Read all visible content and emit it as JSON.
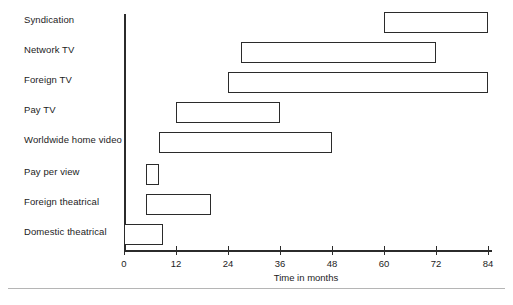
{
  "chart_data": {
    "type": "bar",
    "orientation": "horizontal",
    "subtype": "range-bar",
    "title": "",
    "xlabel": "Time in months",
    "ylabel": "",
    "xlim": [
      0,
      84
    ],
    "xticks": [
      0,
      12,
      24,
      36,
      48,
      60,
      72,
      84
    ],
    "xtick_labels": [
      "0",
      "12",
      "24",
      "36",
      "48",
      "60",
      "72",
      "84"
    ],
    "grid": false,
    "legend": "none",
    "categories": [
      "Syndication",
      "Network TV",
      "Foreign TV",
      "Pay TV",
      "Worldwide home video",
      "Pay per view",
      "Foreign theatrical",
      "Domestic theatrical"
    ],
    "bars": [
      {
        "label": "Syndication",
        "start": 60,
        "end": 84
      },
      {
        "label": "Network TV",
        "start": 27,
        "end": 72
      },
      {
        "label": "Foreign TV",
        "start": 24,
        "end": 84
      },
      {
        "label": "Pay TV",
        "start": 12,
        "end": 36
      },
      {
        "label": "Worldwide home video",
        "start": 8,
        "end": 48
      },
      {
        "label": "Pay per view",
        "start": 5,
        "end": 8
      },
      {
        "label": "Foreign theatrical",
        "start": 5,
        "end": 20
      },
      {
        "label": "Domestic theatrical",
        "start": 0,
        "end": 9
      }
    ],
    "bar_fill_color": "#ffffff",
    "bar_border_color": "#2b2b2b",
    "axis_color": "#2b2b2b",
    "background_color": "#ffffff"
  }
}
